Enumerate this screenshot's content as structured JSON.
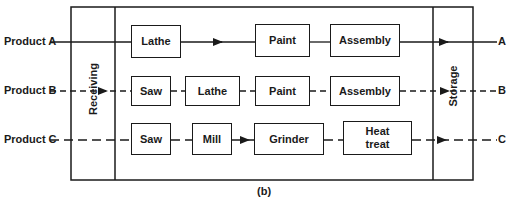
{
  "diagram": {
    "caption": "(b)",
    "zones": {
      "receiving": "Receiving",
      "storage": "Storage"
    },
    "products": [
      {
        "input_label": "Product A",
        "output_label": "A",
        "line_style": "solid",
        "steps": [
          "Lathe",
          "Paint",
          "Assembly"
        ]
      },
      {
        "input_label": "Product B",
        "output_label": "B",
        "line_style": "dashed",
        "steps": [
          "Saw",
          "Lathe",
          "Paint",
          "Assembly"
        ]
      },
      {
        "input_label": "Product C",
        "output_label": "C",
        "line_style": "long-dashed",
        "steps": [
          "Saw",
          "Mill",
          "Grinder",
          "Heat treat"
        ]
      }
    ],
    "colors": {
      "ink": "#1a1a1a",
      "background": "#ffffff"
    }
  }
}
